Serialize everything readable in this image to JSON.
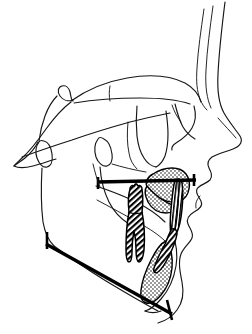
{
  "figure": {
    "kind": "cephalometric-tracing",
    "title": "Lateral cephalometric tracing",
    "orientation": "profile facing right",
    "background_color": "#ffffff",
    "line_color": "#161616",
    "plane_color": "#000000",
    "stipple_color": "#000000",
    "hatch_color": "#000000",
    "canvas": {
      "width": 252,
      "height": 334
    }
  },
  "structures": {
    "soft_tissue_profile": "forehead, nose, upper lip, lower lip, chin outline",
    "cranial_base": "anterior cranial base with sella turcica and clivus",
    "maxilla": "stippled triangular maxillary region",
    "mandible": "ramus, gonial angle, body and stippled symphysis",
    "upper_incisor": "vertically hatched",
    "lower_incisor": "diagonally hatched",
    "molar": "diagonally hatched crown with two roots",
    "occlusal_plane": "thick horizontal reference line",
    "mandibular_plane": "thick oblique reference line with posterior tick"
  },
  "reference_lines": [
    {
      "name": "occlusal-plane",
      "label": "Occlusal plane",
      "x1": 97,
      "y1": 182,
      "x2": 196,
      "y2": 180
    },
    {
      "name": "mandibular-plane",
      "label": "Mandibular plane",
      "x1": 46,
      "y1": 244,
      "x2": 172,
      "y2": 314
    }
  ],
  "hatched_teeth": [
    {
      "name": "molar",
      "hatch": "diagonal"
    },
    {
      "name": "upper-incisor",
      "hatch": "vertical"
    },
    {
      "name": "lower-incisor",
      "hatch": "diagonal"
    }
  ],
  "stippled_regions": [
    {
      "name": "maxillary-body",
      "pattern": "stipple"
    },
    {
      "name": "mandibular-symphysis",
      "pattern": "stipple"
    }
  ]
}
